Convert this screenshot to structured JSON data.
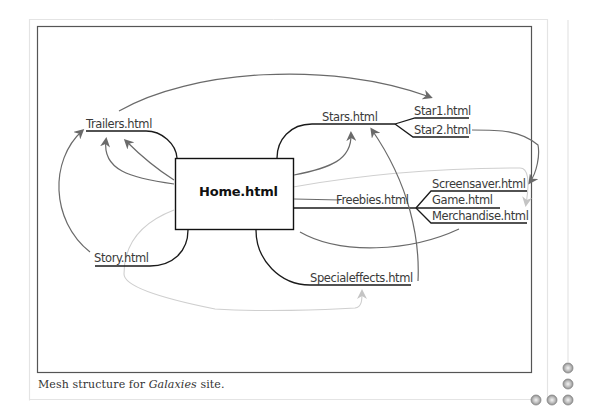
{
  "figure": {
    "caption_prefix": "Mesh structure for ",
    "caption_italic": "Galaxies",
    "caption_suffix": " site."
  },
  "nodes": {
    "home": "Home.html",
    "trailers": "Trailers.html",
    "story": "Story.html",
    "stars": "Stars.html",
    "star1": "Star1.html",
    "star2": "Star2.html",
    "freebies": "Freebies.html",
    "screensaver": "Screensaver.html",
    "game": "Game.html",
    "merchandise": "Merchandise.html",
    "specialeffects": "Specialeffects.html"
  },
  "colors": {
    "hierarchy_line": "#1a1a1a",
    "link_arrow": "#6a6a6a",
    "light_link": "#c8c8c8",
    "frame": "#555555",
    "outer_frame": "#e3e3e3",
    "decor_circle": "#9a9a9a"
  },
  "decoration": {
    "corner_circles": 5
  }
}
